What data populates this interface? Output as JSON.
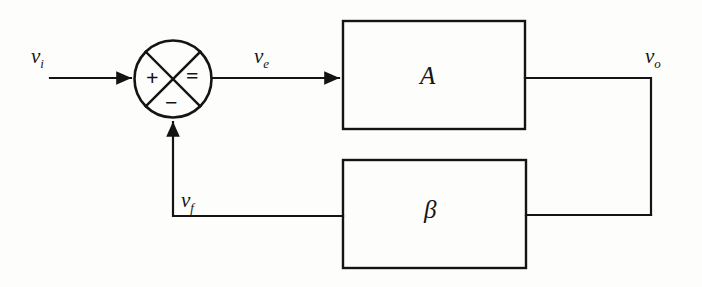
{
  "diagram": {
    "type": "block-diagram",
    "canvas": {
      "width": 702,
      "height": 287
    },
    "colors": {
      "ink": "#141414",
      "paper": "#fdfdfc"
    },
    "signals": {
      "input": {
        "name": "v_i",
        "base": "v",
        "sub": "i",
        "role": "input signal"
      },
      "error": {
        "name": "v_e",
        "base": "v",
        "sub": "e",
        "role": "error signal"
      },
      "output": {
        "name": "v_o",
        "base": "v",
        "sub": "o",
        "role": "output signal"
      },
      "feedback": {
        "name": "v_f",
        "base": "v",
        "sub": "f",
        "role": "feedback signal"
      }
    },
    "blocks": {
      "forward": {
        "label": "A",
        "role": "forward gain amplifier"
      },
      "feedback": {
        "label": "β",
        "role": "feedback network"
      }
    },
    "summing_junction": {
      "name": "summing-junction",
      "shape": "circle-with-cross",
      "operators": {
        "left": "+",
        "right": "=",
        "bottom": "−"
      }
    },
    "equations": {
      "error": "v_e = v_i − v_f",
      "output": "v_o = A · v_e",
      "feedback": "v_f = β · v_o"
    }
  }
}
